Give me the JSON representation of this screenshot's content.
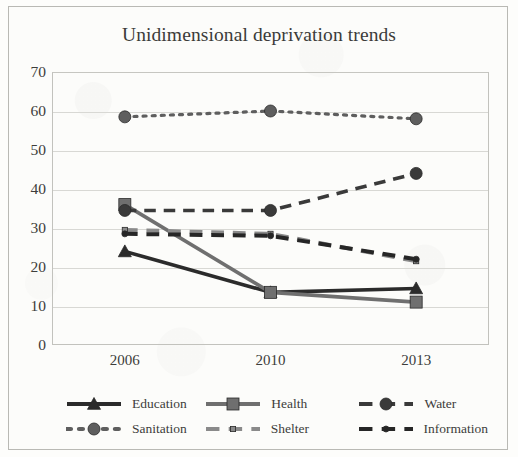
{
  "chart_data": {
    "type": "line",
    "title": "Unidimensional deprivation trends",
    "xlabel": "",
    "ylabel": "",
    "categories": [
      "2006",
      "2010",
      "2013"
    ],
    "x": [
      2006,
      2010,
      2013
    ],
    "ylim": [
      0,
      70
    ],
    "yticks": [
      0,
      10,
      20,
      30,
      40,
      50,
      60,
      70
    ],
    "grid": true,
    "legend_position": "bottom",
    "series": [
      {
        "name": "Education",
        "values": [
          24,
          13.5,
          14.5
        ],
        "color": "#2b2b2b",
        "marker": "triangle",
        "dash": "solid"
      },
      {
        "name": "Health",
        "values": [
          36,
          13.5,
          11
        ],
        "color": "#6f6f6f",
        "marker": "square",
        "dash": "solid"
      },
      {
        "name": "Water",
        "values": [
          34.5,
          34.5,
          44
        ],
        "color": "#3a3a3a",
        "marker": "circle",
        "dash": "dashed"
      },
      {
        "name": "Sanitation",
        "values": [
          58.5,
          60,
          58
        ],
        "color": "#5e5e5e",
        "marker": "circle",
        "dash": "dotted"
      },
      {
        "name": "Shelter",
        "values": [
          29.5,
          28.5,
          21.5
        ],
        "color": "#8a8a8a",
        "marker": "square-small",
        "dash": "dashed"
      },
      {
        "name": "Information",
        "values": [
          28.5,
          28,
          22
        ],
        "color": "#262626",
        "marker": "circle-small",
        "dash": "dashed"
      }
    ]
  },
  "ytick_labels": [
    "70",
    "60",
    "50",
    "40",
    "30",
    "20",
    "10",
    "0"
  ],
  "xtick_labels": [
    "2006",
    "2010",
    "2013"
  ],
  "legend": {
    "rows": [
      [
        {
          "label": "Education"
        },
        {
          "label": "Health"
        },
        {
          "label": "Water"
        }
      ],
      [
        {
          "label": "Sanitation"
        },
        {
          "label": "Shelter"
        },
        {
          "label": "Information"
        }
      ]
    ]
  }
}
